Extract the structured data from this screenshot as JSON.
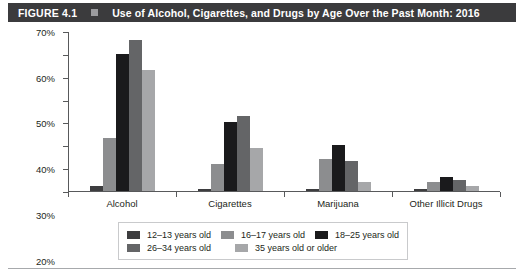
{
  "header": {
    "figure_number": "FIGURE 4.1",
    "bullet_icon": "square-bullet-icon",
    "title": "Use of Alcohol, Cigarettes, and Drugs by Age Over the Past Month: 2016",
    "background_color": "#3b3b3d",
    "text_color": "#ffffff"
  },
  "chart_data": {
    "type": "bar",
    "title": "Use of Alcohol, Cigarettes, and Drugs by Age Over the Past Month: 2016",
    "xlabel": "",
    "ylabel": "",
    "categories": [
      "Alcohol",
      "Cigarettes",
      "Marijuana",
      "Other Illicit Drugs"
    ],
    "series": [
      {
        "name": "12–13 years old",
        "color": "#3d3d3f",
        "values": [
          2,
          1,
          1,
          1
        ]
      },
      {
        "name": "16–17 years old",
        "color": "#8c8d8f",
        "values": [
          23,
          12,
          14,
          4
        ]
      },
      {
        "name": "18–25 years old",
        "color": "#1a1a1c",
        "values": [
          60,
          30,
          20,
          6
        ]
      },
      {
        "name": "26–34 years old",
        "color": "#646567",
        "values": [
          66,
          33,
          13,
          5
        ]
      },
      {
        "name": "35 years old or older",
        "color": "#a6a7a9",
        "values": [
          53,
          19,
          4,
          2
        ]
      }
    ],
    "ylim": [
      0,
      70
    ],
    "yticks": [
      0,
      10,
      20,
      30,
      40,
      50,
      60,
      70
    ],
    "ytick_labels": [
      "0%",
      "10%",
      "20%",
      "30%",
      "40%",
      "50%",
      "60%",
      "70%"
    ],
    "grid": false,
    "legend_position": "bottom"
  },
  "legend": {
    "rows": [
      [
        {
          "label": "12–13 years old",
          "color": "#3d3d3f"
        },
        {
          "label": "16–17 years old",
          "color": "#8c8d8f"
        },
        {
          "label": "18–25 years old",
          "color": "#1a1a1c"
        }
      ],
      [
        {
          "label": "26–34 years old",
          "color": "#646567"
        },
        {
          "label": "35 years old or older",
          "color": "#a6a7a9"
        }
      ]
    ]
  }
}
